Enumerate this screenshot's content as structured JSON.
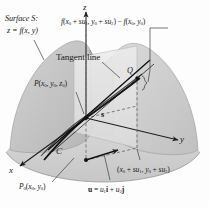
{
  "figure": {
    "kind": "directional-derivative-diagram",
    "background": "#fdfdfd",
    "ink": "#1a1a1a"
  },
  "axes": {
    "z": "z",
    "y": "y",
    "x": "x"
  },
  "labels": {
    "surface_line1": "Surface S:",
    "surface_line2_prefix": "z = f(x, y)",
    "height_difference": "f(x0 + su1, y0 + su2) − f(x0, y0)",
    "tangent_line": "Tangent line",
    "point_P": "P(x0, y0, z0)",
    "point_Q": "Q",
    "curve_C": "C",
    "segment_s": "s",
    "point_P0": "P0(x0, y0)",
    "vector_u": "u = u1i + u2j",
    "foot_point": "(x0 + su1, y0 + su2)"
  },
  "text_parts": {
    "surface_S": "Surface S:",
    "z_eq": "z = f(x, y)",
    "f_open": "f(x",
    "sub_0": "0",
    "plus_su": " + su",
    "sub_1": "1",
    "comma_y": ", y",
    "sub_2": "2",
    "close_paren": ")",
    "minus": " − ",
    "Q": "Q",
    "C": "C",
    "s": "s",
    "P": "P",
    "P0": "P",
    "u": "u",
    "i": "i",
    "j": "j",
    "eq": " = ",
    "plus": " + ",
    "tangent": "Tangent line"
  },
  "colors": {
    "surface_light": "#d9d9d9",
    "surface_mid": "#c4c4c4",
    "surface_dark": "#b0b0b0",
    "plane_vertical": "#e3e3e3",
    "ground": "#cfcfcf",
    "stroke": "#2b2b2b",
    "dashed": "#6e6e6e"
  }
}
